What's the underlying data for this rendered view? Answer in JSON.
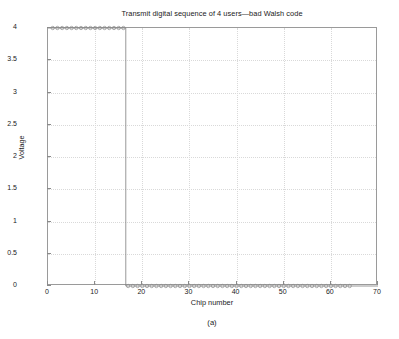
{
  "chart_data": {
    "type": "line",
    "title": "Transmit digital sequence of 4 users—bad Walsh code",
    "xlabel": "Chip number",
    "ylabel": "Voltage",
    "caption": "(a)",
    "xlim": [
      0,
      70
    ],
    "ylim": [
      0,
      4
    ],
    "xticks": [
      0,
      10,
      20,
      30,
      40,
      50,
      60,
      70
    ],
    "yticks": [
      0,
      0.5,
      1,
      1.5,
      2,
      2.5,
      3,
      3.5,
      4
    ],
    "xtick_labels": [
      "0",
      "10",
      "20",
      "30",
      "40",
      "50",
      "60",
      "70"
    ],
    "ytick_labels": [
      "0",
      "0.5",
      "1",
      "1.5",
      "2",
      "2.5",
      "3",
      "3.5",
      "4"
    ],
    "grid": true,
    "grid_style": "dotted",
    "legend": null,
    "marker": "circle",
    "line_color": "#7d7d7d",
    "marker_color": "#8c8c8c",
    "series": [
      {
        "name": "Transmit digital sequence",
        "x": [
          1,
          2,
          3,
          4,
          5,
          6,
          7,
          8,
          9,
          10,
          11,
          12,
          13,
          14,
          15,
          16,
          17,
          18,
          19,
          20,
          21,
          22,
          23,
          24,
          25,
          26,
          27,
          28,
          29,
          30,
          31,
          32,
          33,
          34,
          35,
          36,
          37,
          38,
          39,
          40,
          41,
          42,
          43,
          44,
          45,
          46,
          47,
          48,
          49,
          50,
          51,
          52,
          53,
          54,
          55,
          56,
          57,
          58,
          59,
          60,
          61,
          62,
          63,
          64
        ],
        "values": [
          4,
          4,
          4,
          4,
          4,
          4,
          4,
          4,
          4,
          4,
          4,
          4,
          4,
          4,
          4,
          4,
          0,
          0,
          0,
          0,
          0,
          0,
          0,
          0,
          0,
          0,
          0,
          0,
          0,
          0,
          0,
          0,
          0,
          0,
          0,
          0,
          0,
          0,
          0,
          0,
          0,
          0,
          0,
          0,
          0,
          0,
          0,
          0,
          0,
          0,
          0,
          0,
          0,
          0,
          0,
          0,
          0,
          0,
          0,
          0,
          0,
          0,
          0,
          0
        ]
      }
    ]
  },
  "axes": {
    "frame_color": "#9a9a9a",
    "grid_color": "#d9d9d9",
    "text_color": "#1a1a1a"
  }
}
